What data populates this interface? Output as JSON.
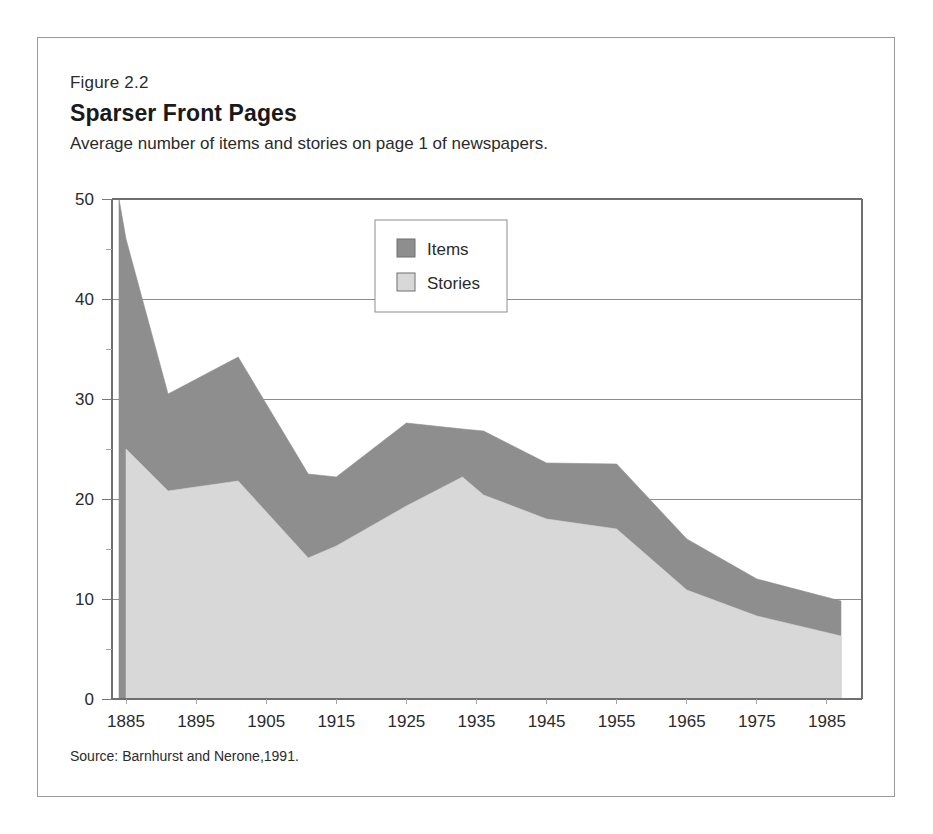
{
  "figure": {
    "number": "Figure 2.2",
    "title": "Sparser Front Pages",
    "subtitle": "Average number of items and stories on page 1 of newspapers.",
    "source": "Source: Barnhurst and Nerone,1991."
  },
  "colors": {
    "items": "#8e8e8e",
    "stories": "#d8d8d8",
    "grid": "#8d8d8d",
    "axis": "#6f6f6f",
    "frame": "#9a9a9a",
    "text": "#2b2b2b",
    "background": "#ffffff"
  },
  "legend": {
    "position": "inside-top-center",
    "entries": [
      {
        "label": "Items",
        "color": "#8e8e8e"
      },
      {
        "label": "Stories",
        "color": "#d8d8d8"
      }
    ]
  },
  "chart_data": {
    "type": "area",
    "title": "Sparser Front Pages",
    "subtitle": "Average number of items and stories on page 1 of newspapers.",
    "xlabel": "",
    "ylabel": "",
    "stacked": false,
    "overlapping": true,
    "grid": true,
    "xlim": [
      1883,
      1990
    ],
    "ylim": [
      0,
      50
    ],
    "yticks": [
      0,
      10,
      20,
      30,
      40,
      50
    ],
    "yticks_minor": [
      5,
      15,
      25,
      35,
      45
    ],
    "ytick_labels": [
      "0",
      "10",
      "20",
      "30",
      "40",
      "50"
    ],
    "xticks": [
      1885,
      1895,
      1905,
      1915,
      1925,
      1935,
      1945,
      1955,
      1965,
      1975,
      1985
    ],
    "xtick_labels": [
      "1885",
      "1895",
      "1905",
      "1915",
      "1925",
      "1935",
      "1945",
      "1955",
      "1965",
      "1975",
      "1985"
    ],
    "x": [
      1884,
      1885,
      1891,
      1901,
      1911,
      1915,
      1925,
      1933,
      1936,
      1945,
      1955,
      1965,
      1975,
      1987
    ],
    "series": [
      {
        "name": "Items",
        "color": "#8e8e8e",
        "values": [
          50.0,
          46.0,
          30.5,
          34.2,
          22.5,
          22.2,
          27.6,
          27.0,
          26.8,
          23.6,
          23.5,
          16.0,
          12.0,
          9.8
        ]
      },
      {
        "name": "Stories",
        "color": "#d8d8d8",
        "values": [
          null,
          25.0,
          20.8,
          21.8,
          14.1,
          15.3,
          19.3,
          22.2,
          20.4,
          18.0,
          17.0,
          10.9,
          8.3,
          6.3
        ]
      }
    ]
  }
}
